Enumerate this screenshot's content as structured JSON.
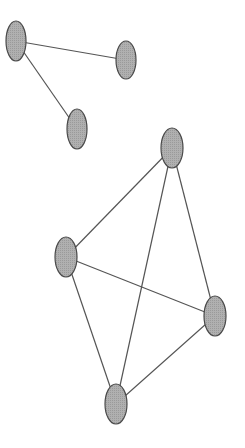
{
  "graph": {
    "node_fill": "#a9a9a9",
    "node_stroke": "#4a4a4a",
    "edge_stroke": "#555555",
    "nodes": [
      {
        "id": "n1",
        "cx": 16,
        "cy": 41,
        "rx": 10,
        "ry": 20
      },
      {
        "id": "n2",
        "cx": 126,
        "cy": 60,
        "rx": 10,
        "ry": 19
      },
      {
        "id": "n3",
        "cx": 77,
        "cy": 129,
        "rx": 10,
        "ry": 20
      },
      {
        "id": "n4",
        "cx": 172,
        "cy": 148,
        "rx": 11,
        "ry": 20
      },
      {
        "id": "n5",
        "cx": 66,
        "cy": 257,
        "rx": 11,
        "ry": 20
      },
      {
        "id": "n6",
        "cx": 215,
        "cy": 316,
        "rx": 11,
        "ry": 20
      },
      {
        "id": "n7",
        "cx": 116,
        "cy": 404,
        "rx": 11,
        "ry": 20
      }
    ],
    "edges": [
      {
        "from": "n1",
        "to": "n2"
      },
      {
        "from": "n1",
        "to": "n3"
      },
      {
        "from": "n4",
        "to": "n5"
      },
      {
        "from": "n4",
        "to": "n7"
      },
      {
        "from": "n4",
        "to": "n6"
      },
      {
        "from": "n5",
        "to": "n6"
      },
      {
        "from": "n5",
        "to": "n7"
      },
      {
        "from": "n7",
        "to": "n6"
      }
    ]
  }
}
